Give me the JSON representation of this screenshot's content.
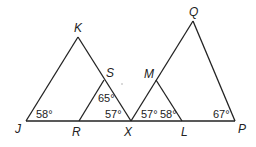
{
  "diagram": {
    "type": "geometry-triangles",
    "line_color": "#222222",
    "background": "#ffffff",
    "vertices": {
      "K": {
        "label": "K"
      },
      "J": {
        "label": "J"
      },
      "S": {
        "label": "S"
      },
      "R": {
        "label": "R"
      },
      "X": {
        "label": "X"
      },
      "M": {
        "label": "M"
      },
      "L": {
        "label": "L"
      },
      "Q": {
        "label": "Q"
      },
      "P": {
        "label": "P"
      }
    },
    "angles": {
      "J": "58°",
      "RSX": "65°",
      "SXR": "57°",
      "MXL": "57°",
      "MLX": "58°",
      "P": "67°"
    },
    "triangles": [
      "JKX",
      "RSX",
      "XML",
      "XQP"
    ]
  }
}
